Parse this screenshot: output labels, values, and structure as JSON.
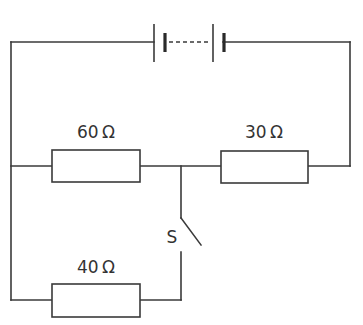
{
  "diagram": {
    "type": "circuit",
    "battery": {
      "label": "",
      "cells": 2,
      "connection": "dashed (multiple cells)"
    },
    "resistors": [
      {
        "id": "r1",
        "label": "60 Ω",
        "value_ohms": 60,
        "position": "middle-left"
      },
      {
        "id": "r2",
        "label": "30 Ω",
        "value_ohms": 30,
        "position": "middle-right"
      },
      {
        "id": "r3",
        "label": "40 Ω",
        "value_ohms": 40,
        "position": "bottom-left"
      }
    ],
    "switch": {
      "label": "S",
      "state": "open"
    }
  }
}
